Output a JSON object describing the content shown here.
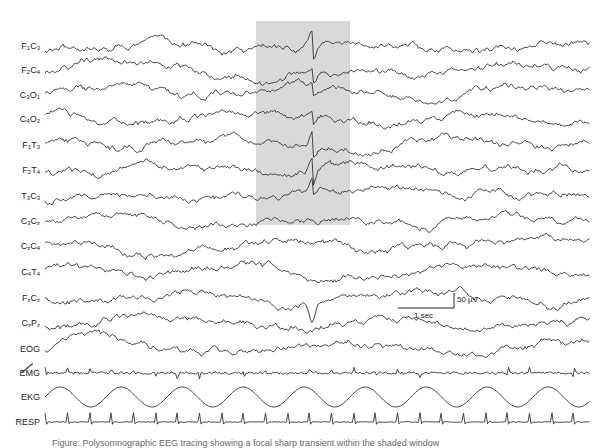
{
  "chart_data": {
    "type": "line",
    "title": "",
    "xlabel": "",
    "ylabel": "",
    "channels": [
      {
        "id": "F1C3",
        "label_main": "F",
        "sub1": "1",
        "mid": "C",
        "sub2": "3",
        "y": 46
      },
      {
        "id": "F2C4",
        "label_main": "F",
        "sub1": "2",
        "mid": "C",
        "sub2": "4",
        "y": 70
      },
      {
        "id": "C3O1",
        "label_main": "C",
        "sub1": "3",
        "mid": "O",
        "sub2": "1",
        "y": 95
      },
      {
        "id": "C4O2",
        "label_main": "C",
        "sub1": "4",
        "mid": "O",
        "sub2": "2",
        "y": 119
      },
      {
        "id": "F1T3",
        "label_main": "F",
        "sub1": "1",
        "mid": "T",
        "sub2": "3",
        "y": 145
      },
      {
        "id": "F2T4",
        "label_main": "F",
        "sub1": "2",
        "mid": "T",
        "sub2": "4",
        "y": 170
      },
      {
        "id": "T3C3",
        "label_main": "T",
        "sub1": "3",
        "mid": "C",
        "sub2": "3",
        "y": 196
      },
      {
        "id": "C3Cz",
        "label_main": "C",
        "sub1": "3",
        "mid": "C",
        "sub2": "z",
        "y": 221
      },
      {
        "id": "CzC4",
        "label_main": "C",
        "sub1": "z",
        "mid": "C",
        "sub2": "4",
        "y": 246
      },
      {
        "id": "C4T4",
        "label_main": "C",
        "sub1": "4",
        "mid": "T",
        "sub2": "4",
        "y": 272
      },
      {
        "id": "FzCz",
        "label_main": "F",
        "sub1": "z",
        "mid": "C",
        "sub2": "z",
        "y": 298
      },
      {
        "id": "CzPz",
        "label_main": "C",
        "sub1": "z",
        "mid": "P",
        "sub2": "z",
        "y": 323
      },
      {
        "id": "EOG",
        "label": "EOG",
        "y": 349
      },
      {
        "id": "EMG",
        "label": "EMG",
        "y": 373
      },
      {
        "id": "EKG",
        "label": "EKG",
        "y": 397
      },
      {
        "id": "RESP",
        "label": "RESP",
        "y": 422
      }
    ],
    "highlight": {
      "x_start": 256,
      "x_end": 350,
      "y_top": 21,
      "y_bottom": 225,
      "color": "#d9d9d9"
    },
    "scale_bar": {
      "time_label": "1 sec",
      "amplitude_label": "50 µV"
    },
    "ekg_wave_count": 9,
    "resp_spike_count": 25,
    "legend": []
  },
  "caption": "Figure: Polysomnographic EEG tracing showing a focal sharp transient within the shaded window"
}
